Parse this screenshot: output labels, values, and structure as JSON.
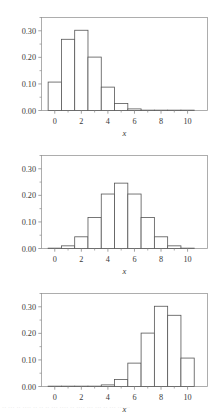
{
  "figure": {
    "title": "",
    "panel_count": 3,
    "background_color": "#ffffff",
    "frame_color": "#9a9a9a",
    "bar_edge_color": "#555555",
    "bar_fill_color": "#ffffff",
    "tick_color": "#8a8a8a",
    "text_color": "#3a3a3a"
  },
  "bottom_caption": {
    "text": "·· ··· ·· ···· ·· ·· ·· ··· ···· ·· ···· ··· ··· ·· ··· ··· ··",
    "visible": true
  },
  "axis": {
    "xlabel": "x",
    "ylabel": "",
    "xtick_labels": [
      "0",
      "2",
      "4",
      "6",
      "8",
      "10"
    ],
    "xtick_values": [
      0,
      2,
      4,
      6,
      8,
      10
    ],
    "x_minor_values": [
      1,
      3,
      5,
      7,
      9
    ],
    "ytick_labels": [
      "0.00",
      "0.10",
      "0.20",
      "0.30"
    ],
    "ytick_values": [
      0.0,
      0.1,
      0.2,
      0.3
    ],
    "y_minor_values": [
      0.05,
      0.15,
      0.25,
      0.35
    ],
    "xlim": [
      -1,
      11.5
    ],
    "ylim": [
      0,
      0.35
    ]
  },
  "chart_data": [
    {
      "type": "bar",
      "title": "",
      "subtitle": "",
      "xlabel": "x",
      "ylabel": "",
      "categories": [
        0,
        1,
        2,
        3,
        4,
        5,
        6,
        7,
        8,
        9,
        10
      ],
      "values": [
        0.107,
        0.268,
        0.302,
        0.201,
        0.088,
        0.026,
        0.006,
        0.001,
        0.0,
        0.0,
        0.0
      ],
      "xtick_labels": [
        "0",
        "2",
        "4",
        "6",
        "8",
        "10"
      ],
      "ytick_labels": [
        "0.00",
        "0.10",
        "0.20",
        "0.30"
      ],
      "xlim": [
        -1,
        11.5
      ],
      "ylim": [
        0,
        0.35
      ],
      "grid": false,
      "legend": "none",
      "legend_position": "none",
      "annotation": ""
    },
    {
      "type": "bar",
      "title": "",
      "subtitle": "",
      "xlabel": "x",
      "ylabel": "",
      "categories": [
        0,
        1,
        2,
        3,
        4,
        5,
        6,
        7,
        8,
        9,
        10
      ],
      "values": [
        0.001,
        0.01,
        0.044,
        0.117,
        0.205,
        0.246,
        0.205,
        0.117,
        0.044,
        0.01,
        0.001
      ],
      "xtick_labels": [
        "0",
        "2",
        "4",
        "6",
        "8",
        "10"
      ],
      "ytick_labels": [
        "0.00",
        "0.10",
        "0.20",
        "0.30"
      ],
      "xlim": [
        -1,
        11.5
      ],
      "ylim": [
        0,
        0.35
      ],
      "grid": false,
      "legend": "none",
      "legend_position": "none",
      "annotation": ""
    },
    {
      "type": "bar",
      "title": "",
      "subtitle": "",
      "xlabel": "x",
      "ylabel": "",
      "categories": [
        0,
        1,
        2,
        3,
        4,
        5,
        6,
        7,
        8,
        9,
        10
      ],
      "values": [
        0.0,
        0.0,
        0.0,
        0.001,
        0.006,
        0.026,
        0.088,
        0.201,
        0.302,
        0.268,
        0.107
      ],
      "xtick_labels": [
        "0",
        "2",
        "4",
        "6",
        "8",
        "10"
      ],
      "ytick_labels": [
        "0.00",
        "0.10",
        "0.20",
        "0.30"
      ],
      "xlim": [
        -1,
        11.5
      ],
      "ylim": [
        0,
        0.35
      ],
      "grid": false,
      "legend": "none",
      "legend_position": "none",
      "annotation": ""
    }
  ]
}
